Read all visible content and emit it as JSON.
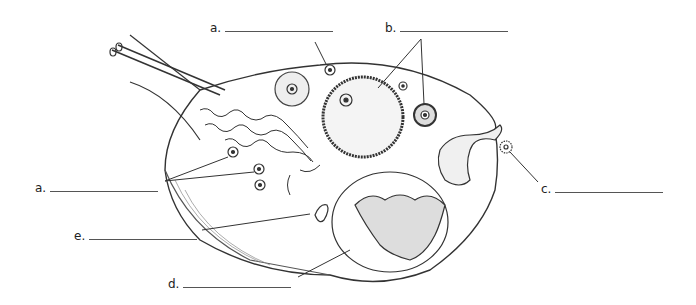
{
  "diagram": {
    "labels": [
      {
        "id": "a-top",
        "letter": "a.",
        "x": 210,
        "y": 21,
        "blank_width": 108
      },
      {
        "id": "b",
        "letter": "b.",
        "x": 385,
        "y": 21,
        "blank_width": 108
      },
      {
        "id": "a-left",
        "letter": "a.",
        "x": 35,
        "y": 181,
        "blank_width": 108
      },
      {
        "id": "c",
        "letter": "c.",
        "x": 541,
        "y": 182,
        "blank_width": 108
      },
      {
        "id": "e",
        "letter": "e.",
        "x": 74,
        "y": 229,
        "blank_width": 108
      },
      {
        "id": "d",
        "letter": "d.",
        "x": 168,
        "y": 277,
        "blank_width": 108
      }
    ]
  }
}
